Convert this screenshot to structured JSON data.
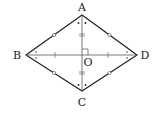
{
  "diagram": {
    "type": "rhombus-with-diagonals",
    "vertices": {
      "A": {
        "label": "A",
        "x": 82,
        "y": 15,
        "label_x": 82,
        "label_y": 11
      },
      "B": {
        "label": "B",
        "x": 26,
        "y": 55,
        "label_x": 17,
        "label_y": 59
      },
      "C": {
        "label": "C",
        "x": 82,
        "y": 91,
        "label_x": 82,
        "label_y": 106
      },
      "D": {
        "label": "D",
        "x": 137,
        "y": 55,
        "label_x": 145,
        "label_y": 59
      }
    },
    "center": {
      "label": "O",
      "x": 82,
      "y": 55,
      "label_x": 88,
      "label_y": 66
    },
    "colors": {
      "stroke": "#222222",
      "diagonal": "#555555",
      "label": "#222222"
    },
    "marks": {
      "side_midpoint": "small-circle",
      "vertical_half_diagonal": "double-tick",
      "horizontal_half_diagonal": "single-tick",
      "angles_at_A_C": "dot",
      "angles_at_B_D": "cross",
      "right_angle_at_O": true
    }
  }
}
